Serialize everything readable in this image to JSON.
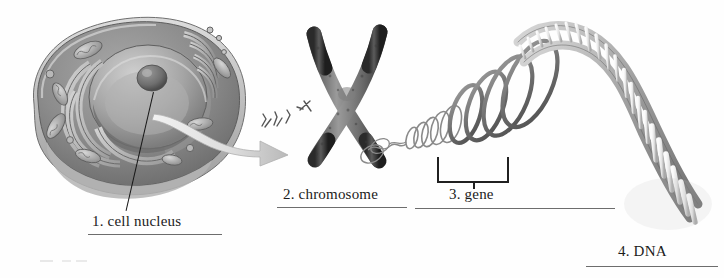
{
  "figure": {
    "background_color": "#fefefe",
    "ink_color": "#1b1b1b",
    "rule_color": "#6d6d6d",
    "style": "grayscale textbook illustration"
  },
  "labels": [
    {
      "id": "cell-nucleus",
      "number": "1.",
      "text": "1. cell nucleus",
      "name": "cell nucleus"
    },
    {
      "id": "chromosome",
      "number": "2.",
      "text": "2. chromosome",
      "name": "chromosome"
    },
    {
      "id": "gene",
      "number": "3.",
      "text": "3. gene",
      "name": "gene"
    },
    {
      "id": "dna",
      "number": "4.",
      "text": "4. DNA",
      "name": "DNA"
    }
  ],
  "stages": {
    "cell": {
      "label": "1. cell nucleus",
      "parts": [
        "cell membrane",
        "cytoplasm",
        "nucleus",
        "nucleolus",
        "endoplasmic reticulum",
        "golgi apparatus",
        "mitochondria"
      ],
      "leader_line": "from nucleus interior down to the label"
    },
    "chromosome": {
      "label": "2. chromosome",
      "shape": "X-shaped duplicated chromosome with centromere",
      "arrow": "pale gray arrow from cell nucleus to chromosome",
      "small_chromosomes": "cluster of tiny chromosome marks above the arrow"
    },
    "gene": {
      "label": "3. gene",
      "bracket": "upward bracket marking a segment of the unwound coil"
    },
    "dna": {
      "label": "4. DNA",
      "shape": "double helix unwinding from looped coils, widening toward lower right",
      "features": [
        "sugar-phosphate backbones",
        "base-pair rungs"
      ]
    }
  }
}
